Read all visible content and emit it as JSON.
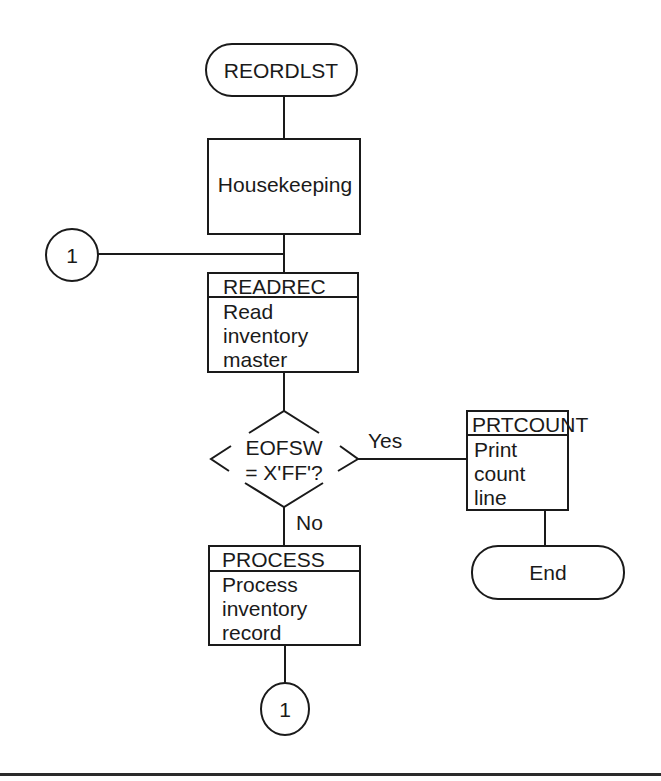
{
  "diagram": {
    "type": "program flowchart",
    "start": {
      "label": "REORDLST",
      "shape": "terminal"
    },
    "housekeeping": {
      "label": "Housekeeping",
      "shape": "process"
    },
    "connector_in": {
      "label": "1",
      "shape": "on-page-connector"
    },
    "readrec": {
      "module": "READREC",
      "lines": [
        "Read",
        "inventory",
        "master"
      ],
      "shape": "predefined-process"
    },
    "decision": {
      "lines": [
        "EOFSW",
        "= X'FF'?"
      ],
      "shape": "decision",
      "yes_label": "Yes",
      "no_label": "No"
    },
    "prtcount": {
      "module": "PRTCOUNT",
      "lines": [
        "Print",
        "count",
        "line"
      ],
      "shape": "predefined-process"
    },
    "end": {
      "label": "End",
      "shape": "terminal"
    },
    "process": {
      "module": "PROCESS",
      "lines": [
        "Process",
        "inventory",
        "record"
      ],
      "shape": "predefined-process"
    },
    "connector_out": {
      "label": "1",
      "shape": "on-page-connector"
    }
  },
  "colors": {
    "ink": "#1a1a1a",
    "paper": "#ffffff"
  }
}
